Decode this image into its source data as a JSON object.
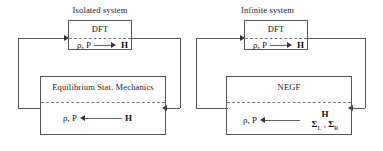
{
  "figure": {
    "background_color": "#ffffff",
    "line_color": "#555555",
    "text_color": "#1a1a1a",
    "dashed_divider_color": "#777777"
  },
  "groups": [
    {
      "id": "isolated",
      "title": "Isolated system",
      "top_box": {
        "title": "DFT",
        "equation": {
          "left": "ρ, P",
          "arrow": "right-arrow",
          "right": "H"
        }
      },
      "bottom_box": {
        "title": "Equilibrium Stat. Mechanics",
        "equation": {
          "left": "ρ, P",
          "arrow": "left-arrow",
          "right": "H"
        }
      }
    },
    {
      "id": "infinite",
      "title": "Infinite system",
      "top_box": {
        "title": "DFT",
        "equation": {
          "left": "ρ, P",
          "arrow": "right-arrow",
          "right": "H"
        }
      },
      "bottom_box": {
        "title": "NEGF",
        "equation": {
          "left": "ρ, P",
          "arrow": "left-arrow",
          "right_line1": "H",
          "right_line2_a": "Σ",
          "right_line2_a_sub": "L",
          "right_line2_sep": " , ",
          "right_line2_b": "Σ",
          "right_line2_b_sub": "R"
        }
      }
    }
  ]
}
